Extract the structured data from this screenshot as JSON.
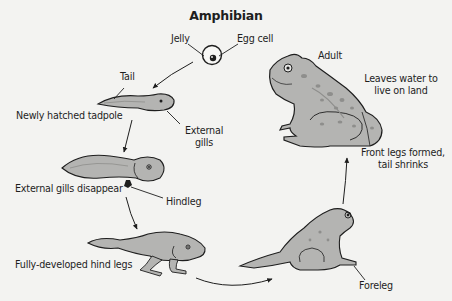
{
  "title": "Amphibian",
  "colors": {
    "background": "#f3f3f1",
    "body_fill": "#b4b4b2",
    "body_fill_light": "#c8c8c6",
    "spot": "#8e8e8c",
    "outline": "#1e1e1e",
    "text": "#1e1e1e"
  },
  "stages": [
    {
      "id": "egg",
      "labels": {
        "jelly": "Jelly",
        "egg_cell": "Egg cell"
      }
    },
    {
      "id": "newly-hatched",
      "caption": "Newly hatched tadpole",
      "labels": {
        "tail": "Tail",
        "external_gills": "External\ngills"
      }
    },
    {
      "id": "gills-disappear",
      "caption": "External gills disappear",
      "labels": {
        "hindleg": "Hindleg"
      }
    },
    {
      "id": "hind-legs",
      "caption": "Fully-developed hind legs"
    },
    {
      "id": "froglet",
      "labels": {
        "foreleg": "Foreleg"
      }
    },
    {
      "id": "adult",
      "caption": "Adult",
      "labels": {
        "front_legs": "Front legs formed,\ntail shrinks",
        "leaves_water": "Leaves water to\nlive on land"
      }
    }
  ],
  "labels": {
    "jelly": "Jelly",
    "egg_cell": "Egg cell",
    "tail": "Tail",
    "newly_hatched": "Newly hatched tadpole",
    "external_gills_1": "External",
    "external_gills_2": "gills",
    "gills_disappear": "External gills disappear",
    "hindleg": "Hindleg",
    "hind_legs": "Fully-developed hind legs",
    "foreleg": "Foreleg",
    "front_legs_1": "Front legs formed,",
    "front_legs_2": "tail shrinks",
    "adult": "Adult",
    "leaves_water_1": "Leaves water to",
    "leaves_water_2": "live on land"
  }
}
